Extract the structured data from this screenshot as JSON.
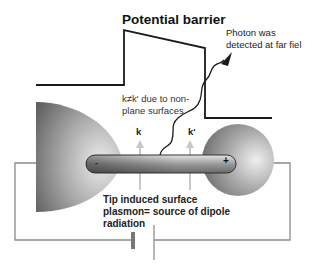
{
  "diagram": {
    "title": "Potential barrier",
    "photon_label_line1": "Photon was",
    "photon_label_line2": "detected at far fiel",
    "k_note_line1": "k≠k' due to non-",
    "k_note_line2": "plane surfaces",
    "k_label": "k",
    "k_prime_label": "k'",
    "minus_sign": "-",
    "plus_sign": "+",
    "tip_label_line1": "Tip induced surface",
    "tip_label_line2": "plasmon= source of dipole",
    "tip_label_line3": "radiation",
    "colors": {
      "line": "#1a1a1a",
      "wire": "#8a8a8a",
      "arrow": "#c8c8c8",
      "metal_dark": "#6e6e6e",
      "metal_light": "#e8e8e8"
    }
  }
}
